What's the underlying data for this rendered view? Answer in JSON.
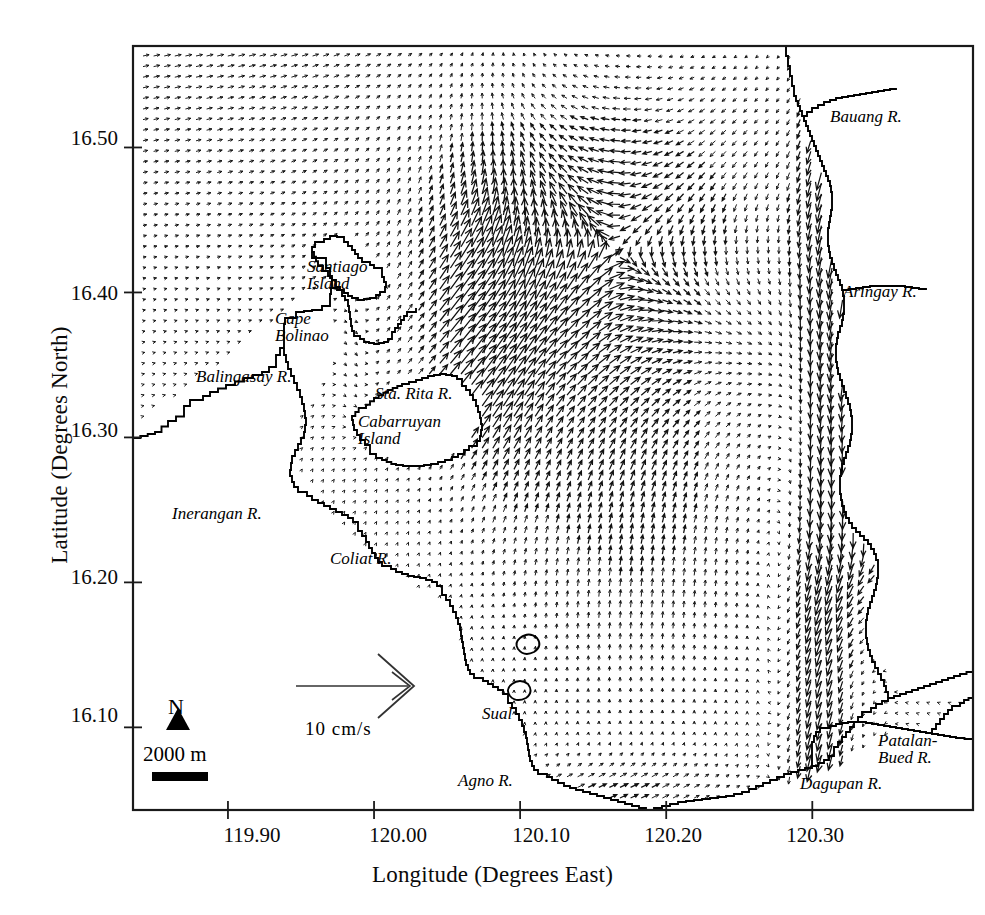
{
  "figure": {
    "type": "vector-field-map",
    "region": "Lingayen Gulf, Philippines",
    "background_color": "#ffffff",
    "ink_color": "#000000"
  },
  "axes": {
    "x": {
      "title": "Longitude (Degrees East)",
      "ticks": [
        "119.90",
        "120.00",
        "120.10",
        "120.20",
        "120.30"
      ],
      "tick_values": [
        119.9,
        120.0,
        120.1,
        120.2,
        120.3
      ],
      "range": [
        119.835,
        120.41
      ]
    },
    "y": {
      "title": "Latitude (Degrees North)",
      "ticks": [
        "16.50",
        "16.40",
        "16.30",
        "16.20",
        "16.10"
      ],
      "tick_values": [
        16.5,
        16.4,
        16.3,
        16.2,
        16.1
      ],
      "range": [
        16.043,
        16.57
      ]
    }
  },
  "legend": {
    "vector_scale_label": "10 cm/s",
    "compass_label": "N",
    "scale_bar_label": "2000 m"
  },
  "place_labels": [
    {
      "name": "santiago-island",
      "text": "Santiago\nIsland",
      "x": 307,
      "y": 258,
      "align": "left"
    },
    {
      "name": "cape-bolinao",
      "text": "Cape\nBolinao",
      "x": 275,
      "y": 310,
      "align": "left"
    },
    {
      "name": "balingasay-river",
      "text": "Balingasay R.",
      "x": 196,
      "y": 368,
      "align": "left"
    },
    {
      "name": "sta-rita-river",
      "text": "Sta. Rita R.",
      "x": 375,
      "y": 385,
      "align": "left"
    },
    {
      "name": "cabarruyan-island",
      "text": "Cabarruyan\nIsland",
      "x": 358,
      "y": 413,
      "align": "left"
    },
    {
      "name": "inerangan-river",
      "text": "Inerangan R.",
      "x": 172,
      "y": 505,
      "align": "left"
    },
    {
      "name": "coliat-river",
      "text": "Coliat R.",
      "x": 330,
      "y": 550,
      "align": "left"
    },
    {
      "name": "sual",
      "text": "Sual",
      "x": 482,
      "y": 705,
      "align": "left"
    },
    {
      "name": "agno-river",
      "text": "Agno R.",
      "x": 458,
      "y": 772,
      "align": "left"
    },
    {
      "name": "dagupan-river",
      "text": "Dagupan R.",
      "x": 800,
      "y": 775,
      "align": "left"
    },
    {
      "name": "patalan-bued-river",
      "text": "Patalan-\nBued R.",
      "x": 878,
      "y": 732,
      "align": "left"
    },
    {
      "name": "bauang-river",
      "text": "Bauang R.",
      "x": 830,
      "y": 108,
      "align": "left"
    },
    {
      "name": "aringay-river",
      "text": "Aringay R.",
      "x": 843,
      "y": 283,
      "align": "left"
    }
  ],
  "chart_data": {
    "type": "quiver",
    "title": "",
    "xlabel": "Longitude (Degrees East)",
    "ylabel": "Latitude (Degrees North)",
    "xlim": [
      119.835,
      120.41
    ],
    "ylim": [
      16.043,
      16.57
    ],
    "xticks": [
      119.9,
      120.0,
      120.1,
      120.2,
      120.3
    ],
    "yticks": [
      16.1,
      16.2,
      16.3,
      16.4,
      16.5
    ],
    "grid": false,
    "legend_position": "lower-center-left",
    "vector_scale": {
      "reference_magnitude": 10,
      "units": "cm/s"
    },
    "flow_zones": [
      {
        "name": "northwest-offshore",
        "mean_direction_deg": 75,
        "mean_magnitude": 6
      },
      {
        "name": "north-central-gyre",
        "mean_direction_deg": 40,
        "mean_magnitude": 11
      },
      {
        "name": "central-gulf-northward-jet",
        "mean_direction_deg": 90,
        "mean_magnitude": 8
      },
      {
        "name": "eastern-coastal-southward",
        "mean_direction_deg": 260,
        "mean_magnitude": 13
      },
      {
        "name": "southeast-eddy",
        "mean_direction_deg": 200,
        "mean_magnitude": 9
      },
      {
        "name": "southern-shore-convergence",
        "mean_direction_deg": 10,
        "mean_magnitude": 7
      },
      {
        "name": "bolinao-channel",
        "mean_direction_deg": 270,
        "mean_magnitude": 5
      }
    ]
  }
}
